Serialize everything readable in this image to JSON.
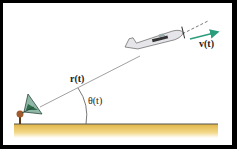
{
  "diagram": {
    "labels": {
      "position_vector": "r(t)",
      "velocity_vector": "v(t)",
      "angle": "θ(t)"
    },
    "colors": {
      "velocity_arrow": "#2a9d7c",
      "ground": "#e8c15a",
      "background": "#ffffff",
      "border": "#000000"
    }
  }
}
